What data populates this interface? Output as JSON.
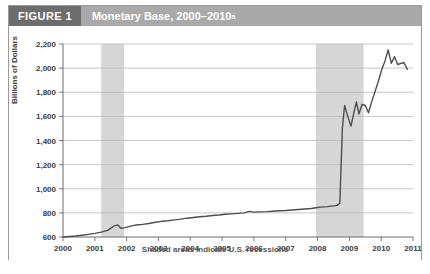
{
  "figure": {
    "tag": "FIGURE 1",
    "title": "Monetary Base, 2000–2010",
    "title_superscript": "a"
  },
  "colors": {
    "tag_bg": "#6d6d6d",
    "header_bg": "#a9a9a9",
    "header_text": "#ffffff",
    "border": "#9a9a9a",
    "line": "#4d4d4d",
    "grid": "#b9b9b9",
    "axis": "#6a6a6a",
    "recession_band": "#d6d6d6",
    "tick_text": "#3a3a3a",
    "plot_bg": "#ffffff"
  },
  "chart_data": {
    "type": "line",
    "title": "Monetary Base, 2000–2010",
    "xlabel": "",
    "ylabel": "Billions of Dollars",
    "annotation": "Shaded areas indicate U.S. recessions",
    "grid": true,
    "legend": "none",
    "xlim": [
      2000,
      2011
    ],
    "ylim": [
      600,
      2200
    ],
    "yticks": [
      600,
      800,
      1000,
      1200,
      1400,
      1600,
      1800,
      2000,
      2200
    ],
    "ytick_labels": [
      "600",
      "800",
      "1,000",
      "1,200",
      "1,400",
      "1,600",
      "1,800",
      "2,000",
      "2,200"
    ],
    "xticks": [
      2000,
      2001,
      2002,
      2003,
      2004,
      2005,
      2006,
      2007,
      2008,
      2009,
      2010,
      2011
    ],
    "xtick_labels": [
      "2000",
      "2001",
      "2002",
      "2003",
      "2004",
      "2005",
      "2006",
      "2007",
      "2008",
      "2009",
      "2010",
      "2011"
    ],
    "shaded_regions": [
      {
        "label": "2001 recession",
        "x0": 2001.2,
        "x1": 2001.92
      },
      {
        "label": "2007–2009 recession",
        "x0": 2007.95,
        "x1": 2009.45
      }
    ],
    "series": [
      {
        "name": "Monetary Base",
        "x": [
          2000.0,
          2000.2,
          2000.4,
          2000.6,
          2000.8,
          2001.0,
          2001.2,
          2001.4,
          2001.6,
          2001.72,
          2001.82,
          2001.95,
          2002.1,
          2002.3,
          2002.5,
          2002.7,
          2002.9,
          2003.1,
          2003.3,
          2003.5,
          2003.7,
          2003.9,
          2004.1,
          2004.3,
          2004.5,
          2004.7,
          2004.9,
          2005.1,
          2005.3,
          2005.5,
          2005.7,
          2005.85,
          2006.0,
          2006.2,
          2006.4,
          2006.6,
          2006.8,
          2007.0,
          2007.2,
          2007.4,
          2007.6,
          2007.8,
          2007.95,
          2008.1,
          2008.3,
          2008.5,
          2008.62,
          2008.7,
          2008.78,
          2008.85,
          2008.95,
          2009.05,
          2009.15,
          2009.22,
          2009.3,
          2009.4,
          2009.5,
          2009.6,
          2009.7,
          2009.8,
          2009.92,
          2010.02,
          2010.12,
          2010.22,
          2010.32,
          2010.42,
          2010.52,
          2010.62,
          2010.72,
          2010.82
        ],
        "y": [
          600,
          604,
          608,
          615,
          622,
          630,
          640,
          655,
          690,
          700,
          672,
          678,
          688,
          700,
          705,
          712,
          722,
          730,
          735,
          742,
          748,
          756,
          762,
          768,
          772,
          778,
          782,
          788,
          792,
          796,
          800,
          812,
          806,
          808,
          810,
          814,
          818,
          820,
          824,
          828,
          832,
          836,
          842,
          848,
          852,
          858,
          862,
          880,
          1500,
          1690,
          1600,
          1520,
          1640,
          1720,
          1620,
          1700,
          1690,
          1630,
          1720,
          1800,
          1900,
          1990,
          2060,
          2150,
          2040,
          2095,
          2030,
          2040,
          2045,
          1990
        ]
      }
    ]
  }
}
